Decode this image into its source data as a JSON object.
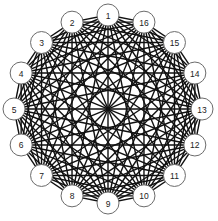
{
  "diagram": {
    "type": "complete-graph",
    "title": "",
    "layout": "circular",
    "center": [
      108,
      109
    ],
    "orbit_radius": 94,
    "node_radius": 11,
    "colors": {
      "background": "#ffffff",
      "edge": "#111111",
      "node_fill": "#ffffff",
      "node_stroke": "#6b6b6b",
      "label": "#222222"
    },
    "nodes": [
      {
        "label": "1",
        "angle_deg": -90
      },
      {
        "label": "2",
        "angle_deg": -112.5
      },
      {
        "label": "3",
        "angle_deg": -135
      },
      {
        "label": "4",
        "angle_deg": -157.5
      },
      {
        "label": "5",
        "angle_deg": 180
      },
      {
        "label": "6",
        "angle_deg": 157.5
      },
      {
        "label": "7",
        "angle_deg": 135
      },
      {
        "label": "8",
        "angle_deg": 112.5
      },
      {
        "label": "9",
        "angle_deg": 90
      },
      {
        "label": "10",
        "angle_deg": 67.5
      },
      {
        "label": "11",
        "angle_deg": 45
      },
      {
        "label": "12",
        "angle_deg": 22.5
      },
      {
        "label": "13",
        "angle_deg": 0
      },
      {
        "label": "14",
        "angle_deg": -22.5
      },
      {
        "label": "15",
        "angle_deg": -45
      },
      {
        "label": "16",
        "angle_deg": -67.5
      }
    ],
    "edges": "all-pairs"
  }
}
